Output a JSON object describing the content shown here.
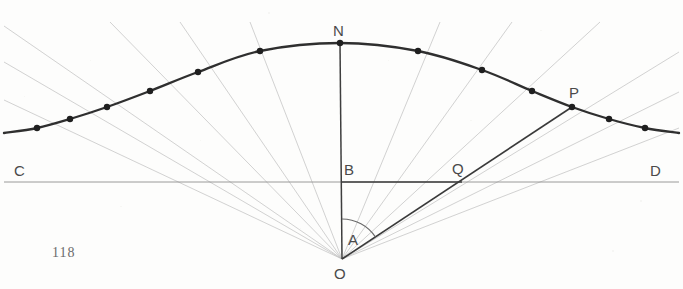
{
  "figure": {
    "page_number": "118",
    "background_color": "#fdfdfc",
    "ink_color": "#3a3a3a",
    "faint_ink_color": "#b9b9b9",
    "labels": [
      {
        "name": "label-N",
        "text": "N",
        "x": 333,
        "y": 22
      },
      {
        "name": "label-P",
        "text": "P",
        "x": 569,
        "y": 84
      },
      {
        "name": "label-C",
        "text": "C",
        "x": 14,
        "y": 162
      },
      {
        "name": "label-D",
        "text": "D",
        "x": 650,
        "y": 162
      },
      {
        "name": "label-B",
        "text": "B",
        "x": 344,
        "y": 161
      },
      {
        "name": "label-Q",
        "text": "Q",
        "x": 452,
        "y": 160
      },
      {
        "name": "label-A",
        "text": "A",
        "x": 348,
        "y": 231
      },
      {
        "name": "label-O",
        "text": "O",
        "x": 334,
        "y": 265
      }
    ]
  },
  "chart_data": {
    "type": "line",
    "xlabel": "",
    "ylabel": "",
    "grid": false,
    "legend": null,
    "origin_point": {
      "name": "O",
      "x": 342,
      "y": 259
    },
    "curve_peak_point": {
      "name": "N",
      "x": 340,
      "y": 43
    },
    "radius_point": {
      "name": "P",
      "x": 572,
      "y": 107
    },
    "axis_line": {
      "name": "CD",
      "x1": 4,
      "y1": 182,
      "x2": 679,
      "y2": 182
    },
    "base_segment": {
      "name": "BQ",
      "x1": 342,
      "y1": 182,
      "x2": 462,
      "y2": 182
    },
    "vertical_line": {
      "name": "ON",
      "x1": 342,
      "y1": 259,
      "x2": 340,
      "y2": 43
    },
    "radius_line": {
      "name": "OP",
      "x1": 342,
      "y1": 259,
      "x2": 572,
      "y2": 107
    },
    "angle_arc": {
      "name": "A",
      "center_x": 342,
      "center_y": 259,
      "radius": 40,
      "start_deg": 90,
      "end_deg": 33.5
    },
    "q_intersection": {
      "name": "Q",
      "x": 462,
      "y": 182
    },
    "plotted_points": [
      {
        "x": 37,
        "y": 128
      },
      {
        "x": 70,
        "y": 119
      },
      {
        "x": 107,
        "y": 107
      },
      {
        "x": 150,
        "y": 91
      },
      {
        "x": 198,
        "y": 72
      },
      {
        "x": 260,
        "y": 51
      },
      {
        "x": 340,
        "y": 43
      },
      {
        "x": 418,
        "y": 51
      },
      {
        "x": 482,
        "y": 70
      },
      {
        "x": 532,
        "y": 91
      },
      {
        "x": 572,
        "y": 107
      },
      {
        "x": 609,
        "y": 119
      },
      {
        "x": 645,
        "y": 128
      }
    ],
    "curve_path": [
      {
        "x": 4,
        "y": 133
      },
      {
        "x": 37,
        "y": 128
      },
      {
        "x": 70,
        "y": 119
      },
      {
        "x": 107,
        "y": 107
      },
      {
        "x": 150,
        "y": 91
      },
      {
        "x": 198,
        "y": 72
      },
      {
        "x": 260,
        "y": 51
      },
      {
        "x": 340,
        "y": 43
      },
      {
        "x": 418,
        "y": 51
      },
      {
        "x": 482,
        "y": 70
      },
      {
        "x": 532,
        "y": 91
      },
      {
        "x": 572,
        "y": 107
      },
      {
        "x": 609,
        "y": 119
      },
      {
        "x": 645,
        "y": 128
      },
      {
        "x": 679,
        "y": 133
      }
    ],
    "radial_lines": [
      {
        "name": "radial-left-1",
        "x1": 342,
        "y1": 259,
        "x2": 4,
        "y2": 26
      },
      {
        "name": "radial-left-2",
        "x1": 342,
        "y1": 259,
        "x2": 4,
        "y2": 62
      },
      {
        "name": "radial-left-3",
        "x1": 342,
        "y1": 259,
        "x2": 4,
        "y2": 100
      },
      {
        "name": "radial-left-4",
        "x1": 342,
        "y1": 259,
        "x2": 110,
        "y2": 22
      },
      {
        "name": "radial-left-5",
        "x1": 342,
        "y1": 259,
        "x2": 180,
        "y2": 22
      },
      {
        "name": "radial-left-6",
        "x1": 342,
        "y1": 259,
        "x2": 250,
        "y2": 22
      },
      {
        "name": "radial-right-1",
        "x1": 342,
        "y1": 259,
        "x2": 440,
        "y2": 22
      },
      {
        "name": "radial-right-2",
        "x1": 342,
        "y1": 259,
        "x2": 512,
        "y2": 22
      },
      {
        "name": "radial-right-3",
        "x1": 342,
        "y1": 259,
        "x2": 600,
        "y2": 22
      },
      {
        "name": "radial-right-4",
        "x1": 342,
        "y1": 259,
        "x2": 679,
        "y2": 52
      },
      {
        "name": "radial-right-5",
        "x1": 342,
        "y1": 259,
        "x2": 679,
        "y2": 92
      },
      {
        "name": "radial-right-6",
        "x1": 342,
        "y1": 259,
        "x2": 679,
        "y2": 128
      }
    ]
  }
}
